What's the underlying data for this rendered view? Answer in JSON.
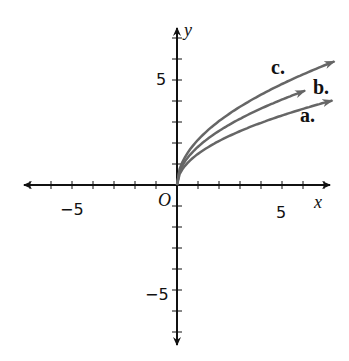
{
  "axes": {
    "x_label": "x",
    "y_label": "y",
    "origin_label": "O",
    "x_ticks": [
      {
        "value": -5,
        "label": "−5"
      },
      {
        "value": 5,
        "label": "5"
      }
    ],
    "y_ticks": [
      {
        "value": 5,
        "label": "5"
      },
      {
        "value": -5,
        "label": "−5"
      }
    ]
  },
  "curves": [
    {
      "label": "a.",
      "k": 1.48,
      "x_end": 7.4,
      "color": "#666666"
    },
    {
      "label": "b.",
      "k": 1.82,
      "x_end": 6.1,
      "color": "#666666"
    },
    {
      "label": "c.",
      "k": 2.15,
      "x_end": 7.5,
      "color": "#666666"
    }
  ],
  "chart_data": {
    "type": "line",
    "title": "",
    "xlabel": "x",
    "ylabel": "y",
    "xlim": [
      -7,
      7
    ],
    "ylim": [
      -7,
      7
    ],
    "grid": false,
    "series": [
      {
        "name": "a.",
        "x": [
          0,
          1,
          2,
          4,
          6,
          7.4
        ],
        "values": [
          0,
          1.48,
          2.09,
          2.96,
          3.63,
          4.03
        ]
      },
      {
        "name": "b.",
        "x": [
          0,
          1,
          2,
          4,
          6,
          6.1
        ],
        "values": [
          0,
          1.82,
          2.57,
          3.64,
          4.46,
          4.5
        ]
      },
      {
        "name": "c.",
        "x": [
          0,
          1,
          2,
          4,
          6,
          7.5
        ],
        "values": [
          0,
          2.15,
          3.04,
          4.3,
          5.27,
          5.89
        ]
      }
    ]
  }
}
